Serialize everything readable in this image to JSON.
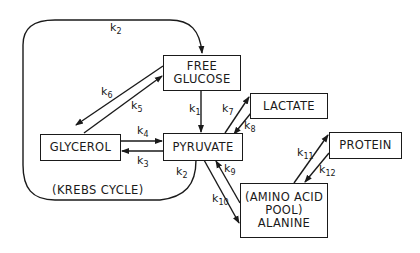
{
  "diagram": {
    "type": "metabolic-compartment-model",
    "nodes": [
      {
        "id": "free_glucose",
        "lines": [
          "FREE",
          "GLUCOSE"
        ]
      },
      {
        "id": "lactate",
        "lines": [
          "LACTATE"
        ]
      },
      {
        "id": "glycerol",
        "lines": [
          "GLYCEROL"
        ]
      },
      {
        "id": "pyruvate",
        "lines": [
          "PYRUVATE"
        ]
      },
      {
        "id": "protein",
        "lines": [
          "PROTEIN"
        ]
      },
      {
        "id": "alanine",
        "lines": [
          "(AMINO ACID",
          "POOL)",
          "ALANINE"
        ]
      }
    ],
    "loop_label": "(KREBS CYCLE)",
    "rate_constants": {
      "k1": {
        "base": "k",
        "sub": "1"
      },
      "k2_top": {
        "base": "k",
        "sub": "2"
      },
      "k2_bottom": {
        "base": "k",
        "sub": "2"
      },
      "k3": {
        "base": "k",
        "sub": "3"
      },
      "k4": {
        "base": "k",
        "sub": "4"
      },
      "k5": {
        "base": "k",
        "sub": "5"
      },
      "k6": {
        "base": "k",
        "sub": "6"
      },
      "k7": {
        "base": "k",
        "sub": "7"
      },
      "k8": {
        "base": "k",
        "sub": "8"
      },
      "k9": {
        "base": "k",
        "sub": "9"
      },
      "k10": {
        "base": "k",
        "sub": "10"
      },
      "k11": {
        "base": "k",
        "sub": "11"
      },
      "k12": {
        "base": "k",
        "sub": "12"
      }
    },
    "edges": [
      {
        "from": "free_glucose",
        "to": "pyruvate",
        "label": "k1"
      },
      {
        "from": "pyruvate",
        "to": "free_glucose",
        "label": "k2",
        "via": "krebs cycle loop"
      },
      {
        "from": "pyruvate",
        "to": "glycerol",
        "label": "k3"
      },
      {
        "from": "glycerol",
        "to": "pyruvate",
        "label": "k4"
      },
      {
        "from": "glycerol",
        "to": "free_glucose",
        "label": "k5"
      },
      {
        "from": "free_glucose",
        "to": "glycerol",
        "label": "k6"
      },
      {
        "from": "pyruvate",
        "to": "lactate",
        "label": "k7"
      },
      {
        "from": "lactate",
        "to": "pyruvate",
        "label": "k8"
      },
      {
        "from": "alanine",
        "to": "pyruvate",
        "label": "k9"
      },
      {
        "from": "pyruvate",
        "to": "alanine",
        "label": "k10"
      },
      {
        "from": "alanine",
        "to": "protein",
        "label": "k11"
      },
      {
        "from": "protein",
        "to": "alanine",
        "label": "k12"
      }
    ],
    "colors": {
      "ink": "#1a1a1a",
      "background": "#ffffff"
    }
  }
}
